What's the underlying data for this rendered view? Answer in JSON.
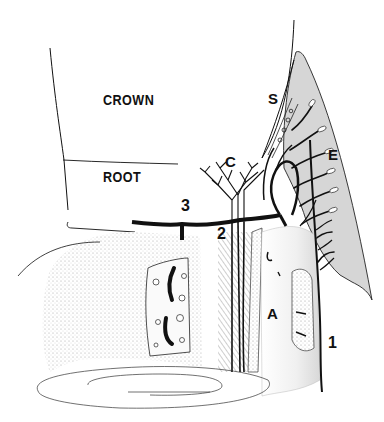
{
  "diagram": {
    "type": "anatomical cross-section illustration",
    "regions": {
      "crown": "CROWN",
      "root": "ROOT"
    },
    "labels": [
      {
        "id": "S",
        "text": "S"
      },
      {
        "id": "E",
        "text": "E"
      },
      {
        "id": "C",
        "text": "C"
      },
      {
        "id": "3",
        "text": "3"
      },
      {
        "id": "2",
        "text": "2"
      },
      {
        "id": "A",
        "text": "A"
      },
      {
        "id": "1",
        "text": "1"
      }
    ],
    "colors": {
      "ink": "#111111",
      "shade": "#d9d9d9",
      "stipple": "#e6e6e6",
      "background": "#ffffff"
    }
  }
}
